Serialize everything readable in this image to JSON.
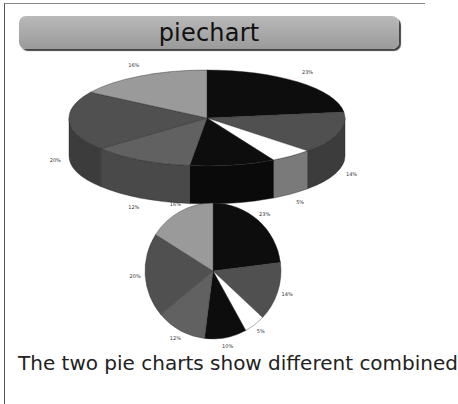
{
  "title": "piechart",
  "caption": "The two pie charts show different combined",
  "colors": {
    "black": "#0d0d0d",
    "dark_gray": "#505050",
    "medium_gray": "#616161",
    "light_gray": "#9a9a9a",
    "white": "#ffffff"
  },
  "chart_data": [
    {
      "type": "pie",
      "style": "3d",
      "title": "",
      "categories": [
        "A",
        "B",
        "C",
        "D",
        "E",
        "F",
        "G"
      ],
      "values": [
        23,
        14,
        5,
        10,
        12,
        20,
        16
      ],
      "labels": [
        "23%",
        "14%",
        "5%",
        "10%",
        "12%",
        "20%",
        "16%"
      ],
      "slice_colors": [
        "#0d0d0d",
        "#505050",
        "#ffffff",
        "#0d0d0d",
        "#616161",
        "#505050",
        "#9a9a9a"
      ],
      "start_angle": "12 o'clock, clockwise",
      "legend": "none"
    },
    {
      "type": "pie",
      "style": "2d",
      "title": "",
      "categories": [
        "A",
        "B",
        "C",
        "D",
        "E",
        "F",
        "G"
      ],
      "values": [
        23,
        14,
        5,
        10,
        12,
        20,
        16
      ],
      "labels": [
        "23%",
        "14%",
        "5%",
        "10%",
        "12%",
        "20%",
        "16%"
      ],
      "slice_colors": [
        "#0d0d0d",
        "#505050",
        "#ffffff",
        "#0d0d0d",
        "#616161",
        "#505050",
        "#9a9a9a"
      ],
      "start_angle": "12 o'clock, clockwise",
      "legend": "none"
    }
  ]
}
